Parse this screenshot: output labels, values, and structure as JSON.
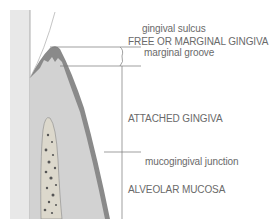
{
  "diagram": {
    "labels": [
      {
        "id": "gingival-sulcus",
        "text": "gingival sulcus"
      },
      {
        "id": "free-gingiva",
        "text": "FREE OR MARGINAL GINGIVA"
      },
      {
        "id": "marginal-groove",
        "text": "marginal groove"
      },
      {
        "id": "attached-gingiva",
        "text": "ATTACHED GINGIVA"
      },
      {
        "id": "mucogingival-junction",
        "text": "mucogingival junction"
      },
      {
        "id": "alveolar-mucosa",
        "text": "ALVEOLAR MUCOSA"
      }
    ],
    "colors": {
      "tooth": "#e4e4e4",
      "gingiva": "#cfcfcf",
      "epithelium": "#8a8a8a",
      "bone": "#d8d4c8",
      "bone_dots": "#555555",
      "lines": "#777777"
    }
  }
}
